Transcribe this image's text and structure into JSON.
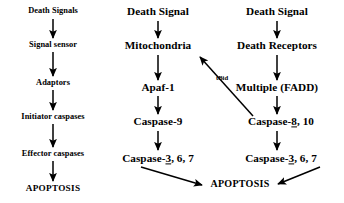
{
  "diagram": {
    "background": "#ffffff",
    "ink": "#000000",
    "columns": [
      {
        "id": "generic",
        "name": "generic-pathway",
        "nodes": [
          {
            "id": "death-signals",
            "label": "Death Signals",
            "x": 53,
            "y": 11
          },
          {
            "id": "signal-sensor",
            "label": "Signal sensor",
            "x": 53,
            "y": 45
          },
          {
            "id": "adaptors",
            "label": "Adaptors",
            "x": 53,
            "y": 83
          },
          {
            "id": "initiator-caspases",
            "label": "Initiator caspases",
            "x": 53,
            "y": 117
          },
          {
            "id": "effector-caspases",
            "label": "Effector caspases",
            "x": 53,
            "y": 154
          },
          {
            "id": "apoptosis-left",
            "label": "APOPTOSIS",
            "x": 53,
            "y": 189
          }
        ]
      },
      {
        "id": "intrinsic",
        "name": "mitochondrial-pathway",
        "nodes": [
          {
            "id": "death-signal-mid",
            "label": "Death Signal",
            "x": 158,
            "y": 12
          },
          {
            "id": "mitochondria",
            "label": "Mitochondria",
            "x": 158,
            "y": 46
          },
          {
            "id": "apaf-1",
            "label": "Apaf-1",
            "x": 158,
            "y": 88
          },
          {
            "id": "caspase-9",
            "label": "Caspase-9",
            "x": 158,
            "y": 122
          },
          {
            "id": "caspase-3-6-7-mid",
            "label": "Caspase-3, 6, 7",
            "underlined": "3",
            "x": 158,
            "y": 159
          }
        ]
      },
      {
        "id": "extrinsic",
        "name": "death-receptor-pathway",
        "nodes": [
          {
            "id": "death-signal-right",
            "label": "Death Signal",
            "x": 277,
            "y": 12
          },
          {
            "id": "death-receptors",
            "label": "Death Receptors",
            "x": 277,
            "y": 46
          },
          {
            "id": "multiple-fadd",
            "label": "Multiple (FADD)",
            "x": 277,
            "y": 88
          },
          {
            "id": "caspase-8-10",
            "label": "Caspase-8, 10",
            "underlined": "8",
            "x": 281,
            "y": 122
          },
          {
            "id": "caspase-3-6-7-right",
            "label": "Caspase-3, 6, 7",
            "underlined": "3",
            "x": 281,
            "y": 159
          }
        ]
      }
    ],
    "shared_nodes": [
      {
        "id": "apoptosis-center",
        "label": "APOPTOSIS",
        "x": 240,
        "y": 184
      }
    ],
    "edge_labels": [
      {
        "id": "tbid",
        "label": "tBid",
        "x": 222,
        "y": 78
      }
    ],
    "arrows": [
      {
        "id": "a1",
        "from": "death-signals",
        "to": "signal-sensor",
        "x1": 53,
        "y1": 19,
        "x2": 53,
        "y2": 38
      },
      {
        "id": "a2",
        "from": "signal-sensor",
        "to": "adaptors",
        "x1": 53,
        "y1": 52,
        "x2": 53,
        "y2": 76
      },
      {
        "id": "a3",
        "from": "adaptors",
        "to": "initiator-caspases",
        "x1": 53,
        "y1": 90,
        "x2": 53,
        "y2": 110
      },
      {
        "id": "a4",
        "from": "initiator-caspases",
        "to": "effector-caspases",
        "x1": 53,
        "y1": 124,
        "x2": 53,
        "y2": 147
      },
      {
        "id": "a5",
        "from": "effector-caspases",
        "to": "apoptosis-left",
        "x1": 53,
        "y1": 161,
        "x2": 53,
        "y2": 181
      },
      {
        "id": "a6",
        "from": "death-signal-mid",
        "to": "mitochondria",
        "x1": 158,
        "y1": 21,
        "x2": 158,
        "y2": 38
      },
      {
        "id": "a7",
        "from": "mitochondria",
        "to": "apaf-1",
        "x1": 158,
        "y1": 55,
        "x2": 158,
        "y2": 80
      },
      {
        "id": "a8",
        "from": "apaf-1",
        "to": "caspase-9",
        "x1": 158,
        "y1": 96,
        "x2": 158,
        "y2": 114
      },
      {
        "id": "a9",
        "from": "caspase-9",
        "to": "caspase-3-6-7-mid",
        "x1": 158,
        "y1": 131,
        "x2": 158,
        "y2": 150
      },
      {
        "id": "a10",
        "from": "death-signal-right",
        "to": "death-receptors",
        "x1": 277,
        "y1": 21,
        "x2": 277,
        "y2": 38
      },
      {
        "id": "a11",
        "from": "death-receptors",
        "to": "multiple-fadd",
        "x1": 277,
        "y1": 55,
        "x2": 277,
        "y2": 80
      },
      {
        "id": "a12",
        "from": "multiple-fadd",
        "to": "caspase-8-10",
        "x1": 277,
        "y1": 96,
        "x2": 277,
        "y2": 114
      },
      {
        "id": "a13",
        "from": "caspase-8-10",
        "to": "caspase-3-6-7-right",
        "x1": 277,
        "y1": 131,
        "x2": 277,
        "y2": 150
      },
      {
        "id": "a14",
        "from": "caspase-8-10",
        "to": "mitochondria",
        "x1": 253,
        "y1": 116,
        "x2": 200,
        "y2": 57,
        "label": "tBid"
      },
      {
        "id": "a15",
        "from": "caspase-3-6-7-mid",
        "to": "apoptosis-center",
        "x1": 141,
        "y1": 167,
        "x2": 202,
        "y2": 185
      },
      {
        "id": "a16",
        "from": "caspase-3-6-7-right",
        "to": "apoptosis-center",
        "x1": 320,
        "y1": 167,
        "x2": 278,
        "y2": 184
      }
    ]
  }
}
